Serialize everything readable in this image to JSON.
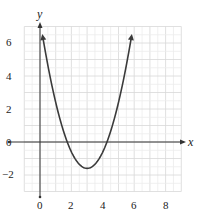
{
  "chart_data": {
    "type": "line",
    "title": "",
    "xlabel": "x",
    "ylabel": "y",
    "xlim": [
      -1,
      9
    ],
    "ylim": [
      -3,
      7
    ],
    "grid": true,
    "grid_step": 0.5,
    "x_ticks": [
      "0",
      "2",
      "4",
      "6",
      "8"
    ],
    "y_ticks": [
      "6",
      "4",
      "2",
      "0",
      "-2"
    ],
    "series": [
      {
        "name": "parabola",
        "equation_estimate": "y = (x - 3)^2 - 1.6",
        "x": [
          0.2,
          0.5,
          1,
          1.5,
          2,
          2.5,
          3,
          3.5,
          4,
          4.5,
          5,
          5.5,
          5.8
        ],
        "y": [
          6.2,
          4.65,
          2.4,
          0.65,
          -0.6,
          -1.35,
          -1.6,
          -1.35,
          -0.6,
          0.65,
          2.4,
          4.65,
          6.2
        ],
        "arrows_at_ends": true
      }
    ],
    "vertex": [
      3,
      -1.6
    ],
    "x_intercepts": [
      1.74,
      4.26
    ]
  },
  "labels": {
    "x_axis": "x",
    "y_axis": "y",
    "x_ticks": [
      "0",
      "2",
      "4",
      "6",
      "8"
    ],
    "y_ticks": [
      "6",
      "4",
      "2",
      "0",
      "−2"
    ]
  },
  "colors": {
    "curve": "#3a3a3a",
    "axis": "#333333",
    "grid_major": "#d8d8d8",
    "grid_minor": "#ececec"
  }
}
